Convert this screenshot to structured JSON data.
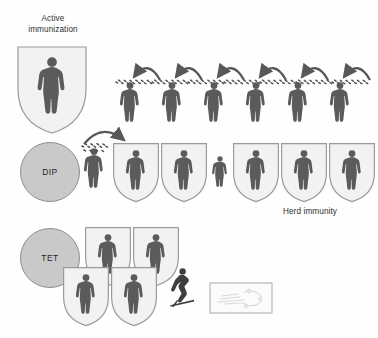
{
  "figure": {
    "type": "diagram",
    "background_color": "#fefefe",
    "width": 378,
    "height": 338
  },
  "colors": {
    "person_fill": "#5b5b5b",
    "person_fill_dark": "#3f3f3f",
    "shield_fill": "#f2f2f2",
    "shield_stroke": "#9a9a9a",
    "circle_fill": "#c9c9c9",
    "circle_stroke": "#8d8d8d",
    "arrow": "#585858",
    "germ": "#4a4a4a",
    "text": "#2e2e2e",
    "photo_fill": "#fbfbfb",
    "photo_stroke": "#a8a8a8"
  },
  "labels": {
    "title": "Active\nimmunization",
    "herd_immunity": "Herd immunity"
  },
  "badges": [
    {
      "id": "dip",
      "text": "DIP",
      "x": 20,
      "y": 142,
      "size": 58
    },
    {
      "id": "tet",
      "text": "TET",
      "x": 20,
      "y": 228,
      "size": 58
    }
  ],
  "rows": {
    "hero": {
      "name": "active-immunization-hero",
      "shield": {
        "x": 16,
        "y": 45,
        "w": 72,
        "h": 88,
        "person_scale": 1.0
      }
    },
    "top_row": {
      "name": "unprotected-transmission-chain",
      "description": "six unshielded people with germ clouds and chained transmission arrows",
      "people_count": 6,
      "people_x": [
        130,
        172,
        214,
        256,
        298,
        340
      ],
      "people_y": 80,
      "person_w": 26,
      "person_h": 44,
      "arrows_count": 6,
      "germ_band_y": 84
    },
    "middle_row": {
      "name": "herd-immunity-row",
      "description": "one infected unshielded person transmits to a shielded person; remaining people shielded except one small unshielded",
      "items": [
        {
          "kind": "person",
          "shielded": false,
          "infected": true,
          "x": 86,
          "y": 148,
          "w": 26,
          "h": 44
        },
        {
          "kind": "person",
          "shielded": true,
          "infected": false,
          "x": 112,
          "y": 142,
          "w": 48,
          "h": 60
        },
        {
          "kind": "person",
          "shielded": true,
          "infected": false,
          "x": 160,
          "y": 142,
          "w": 48,
          "h": 60
        },
        {
          "kind": "person",
          "shielded": false,
          "infected": false,
          "x": 208,
          "y": 155,
          "w": 20,
          "h": 34
        },
        {
          "kind": "person",
          "shielded": true,
          "infected": false,
          "x": 232,
          "y": 142,
          "w": 48,
          "h": 60
        },
        {
          "kind": "person",
          "shielded": true,
          "infected": false,
          "x": 280,
          "y": 142,
          "w": 48,
          "h": 60
        },
        {
          "kind": "person",
          "shielded": true,
          "infected": false,
          "x": 328,
          "y": 142,
          "w": 48,
          "h": 60
        }
      ],
      "arrow": {
        "from_x": 96,
        "to_x": 136,
        "y": 134
      }
    },
    "bottom_row": {
      "name": "tetanus-protected-cluster",
      "description": "four shielded people in a staggered two-by-two cluster",
      "shields": [
        {
          "x": 84,
          "y": 228,
          "w": 48,
          "h": 62
        },
        {
          "x": 132,
          "y": 228,
          "w": 48,
          "h": 62
        },
        {
          "x": 62,
          "y": 268,
          "w": 48,
          "h": 62
        },
        {
          "x": 110,
          "y": 268,
          "w": 48,
          "h": 62
        }
      ],
      "injury_figure": {
        "name": "injured-person-with-nail",
        "x": 176,
        "y": 268,
        "w": 22,
        "h": 42
      },
      "photo_card": {
        "name": "wound-photo-card",
        "x": 210,
        "y": 283,
        "w": 62,
        "h": 30
      }
    }
  }
}
